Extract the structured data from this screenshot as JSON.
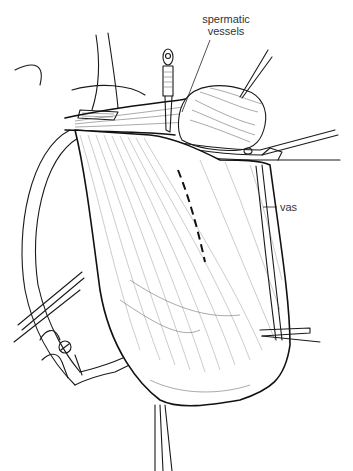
{
  "figure": {
    "type": "surgical line illustration",
    "labels": [
      {
        "id": "spermatic-vessels",
        "text_line1": "spermatic",
        "text_line2": "vessels"
      },
      {
        "id": "vas",
        "text": "vas"
      }
    ],
    "colors": {
      "background": "#ffffff",
      "ink": "#1a1a1a",
      "label_text": "#333333"
    }
  }
}
